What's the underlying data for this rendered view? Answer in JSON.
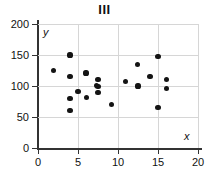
{
  "chart_data": {
    "type": "scatter",
    "title": "III",
    "xlabel": "x",
    "ylabel": "y",
    "xlim": [
      0,
      20
    ],
    "ylim": [
      0,
      200
    ],
    "xticks": [
      0,
      5,
      10,
      15,
      20
    ],
    "yticks": [
      0,
      50,
      100,
      150,
      200
    ],
    "xtick_labels": [
      "0",
      "5",
      "10",
      "15",
      "20"
    ],
    "ytick_labels": [
      "0",
      "50",
      "100",
      "150",
      "200"
    ],
    "grid": true,
    "grid_axis": "both",
    "legend": false,
    "marker": "filled-circle",
    "marker_color": "#141414",
    "points": [
      {
        "x": 1.9,
        "y": 125
      },
      {
        "x": 4.0,
        "y": 150
      },
      {
        "x": 4.0,
        "y": 115
      },
      {
        "x": 4.0,
        "y": 80
      },
      {
        "x": 4.0,
        "y": 60
      },
      {
        "x": 5.0,
        "y": 91
      },
      {
        "x": 6.0,
        "y": 121
      },
      {
        "x": 6.1,
        "y": 81
      },
      {
        "x": 7.3,
        "y": 101
      },
      {
        "x": 7.5,
        "y": 110
      },
      {
        "x": 7.5,
        "y": 99
      },
      {
        "x": 7.5,
        "y": 90
      },
      {
        "x": 9.2,
        "y": 70
      },
      {
        "x": 10.9,
        "y": 107
      },
      {
        "x": 12.4,
        "y": 135
      },
      {
        "x": 12.5,
        "y": 100
      },
      {
        "x": 14.0,
        "y": 115
      },
      {
        "x": 15.0,
        "y": 147
      },
      {
        "x": 15.0,
        "y": 65
      },
      {
        "x": 16.1,
        "y": 111
      },
      {
        "x": 16.1,
        "y": 96
      }
    ]
  }
}
